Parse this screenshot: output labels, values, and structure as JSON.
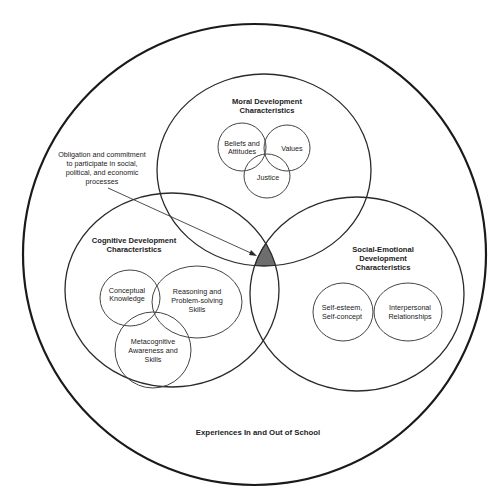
{
  "diagram": {
    "outer_context": {
      "label": "Experiences In and Out of School"
    },
    "domains": [
      {
        "id": "moral",
        "title_line1": "Moral Development",
        "title_line2": "Characteristics",
        "components": [
          {
            "line1": "Beliefs and",
            "line2": "Attitudes"
          },
          {
            "line1": "Values"
          },
          {
            "line1": "Justice"
          }
        ]
      },
      {
        "id": "cognitive",
        "title_line1": "Cognitive Development",
        "title_line2": "Characteristics",
        "components": [
          {
            "line1": "Conceptual",
            "line2": "Knowledge"
          },
          {
            "line1": "Reasoning and",
            "line2": "Problem-solving",
            "line3": "Skills"
          },
          {
            "line1": "Metacognitive",
            "line2": "Awareness and",
            "line3": "Skills"
          }
        ]
      },
      {
        "id": "social_emotional",
        "title_line1": "Social-Emotional",
        "title_line2": "Development",
        "title_line3": "Characteristics",
        "components": [
          {
            "line1": "Self-esteem,",
            "line2": "Self-concept"
          },
          {
            "line1": "Interpersonal",
            "line2": "Relationships"
          }
        ]
      }
    ],
    "intersection_note": {
      "line1": "Obligation and commitment",
      "line2": "to participate in social,",
      "line3": "political, and economic",
      "line4": "processes"
    },
    "colors": {
      "shaded_intersection": "#6e6e6e",
      "stroke": "#1a1a1a",
      "background": "#ffffff"
    }
  }
}
